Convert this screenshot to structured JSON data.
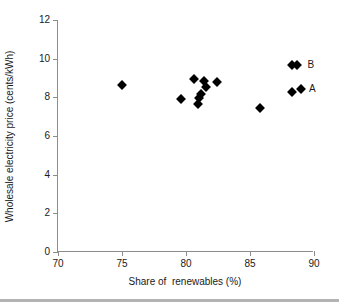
{
  "chart_data": {
    "type": "scatter",
    "title": "",
    "xlabel": "Share of  renewables (%)",
    "ylabel": "Wholesale electricity price (cents/kWh)",
    "xlim": [
      70,
      90
    ],
    "ylim": [
      0,
      12
    ],
    "xticks": [
      70,
      75,
      80,
      85,
      90
    ],
    "yticks": [
      0,
      2,
      4,
      6,
      8,
      10,
      12
    ],
    "grid": false,
    "legend_position": "inline-annotation",
    "marker": "diamond",
    "marker_color": "#000000",
    "points": [
      {
        "x": 75.0,
        "y": 8.65,
        "label": ""
      },
      {
        "x": 79.6,
        "y": 7.9,
        "label": ""
      },
      {
        "x": 80.6,
        "y": 8.95,
        "label": ""
      },
      {
        "x": 80.9,
        "y": 7.65,
        "label": ""
      },
      {
        "x": 81.0,
        "y": 7.95,
        "label": ""
      },
      {
        "x": 81.2,
        "y": 8.15,
        "label": ""
      },
      {
        "x": 81.4,
        "y": 8.85,
        "label": ""
      },
      {
        "x": 81.6,
        "y": 8.55,
        "label": ""
      },
      {
        "x": 82.4,
        "y": 8.8,
        "label": ""
      },
      {
        "x": 85.8,
        "y": 7.45,
        "label": ""
      },
      {
        "x": 88.3,
        "y": 9.65,
        "label": "B"
      },
      {
        "x": 88.7,
        "y": 9.65,
        "label": "B"
      },
      {
        "x": 88.3,
        "y": 8.3,
        "label": "A"
      },
      {
        "x": 89.0,
        "y": 8.45,
        "label": "A"
      }
    ],
    "annotations": [
      {
        "text": "B",
        "x": 89.5,
        "y": 9.65
      },
      {
        "text": "A",
        "x": 89.6,
        "y": 8.45
      }
    ]
  }
}
